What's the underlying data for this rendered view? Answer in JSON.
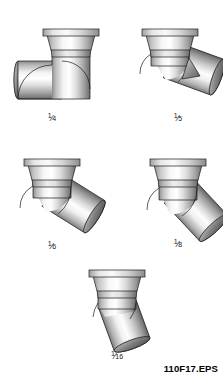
{
  "figure": {
    "id_label": "110F17.EPS",
    "background_color": "#ffffff",
    "line_color": "#1a1a1a",
    "metal_light": "#ffffff",
    "metal_mid": "#c9c9c9",
    "metal_dark": "#6e6e6e",
    "metal_shadow": "#4a4a4a"
  },
  "fittings": [
    {
      "key": "quarter-bend",
      "label_numerator": "1",
      "label_slash": "⁄",
      "label_denominator": "4",
      "label_text": "1⁄4",
      "angle_degrees": 90,
      "position": {
        "label_x": 52,
        "label_y": 112
      }
    },
    {
      "key": "fifth-bend",
      "label_numerator": "1",
      "label_slash": "⁄",
      "label_denominator": "5",
      "label_text": "1⁄5",
      "angle_degrees": 72,
      "position": {
        "label_x": 178,
        "label_y": 112
      }
    },
    {
      "key": "sixth-bend",
      "label_numerator": "1",
      "label_slash": "⁄",
      "label_denominator": "6",
      "label_text": "1⁄6",
      "angle_degrees": 60,
      "position": {
        "label_x": 52,
        "label_y": 240
      }
    },
    {
      "key": "eighth-bend",
      "label_numerator": "1",
      "label_slash": "⁄",
      "label_denominator": "8",
      "label_text": "1⁄8",
      "angle_degrees": 45,
      "position": {
        "label_x": 178,
        "label_y": 238
      }
    },
    {
      "key": "sixteenth-bend",
      "label_numerator": "1",
      "label_slash": "⁄",
      "label_denominator": "16",
      "label_text": "1⁄16",
      "angle_degrees": 22.5,
      "position": {
        "label_x": 117,
        "label_y": 350
      }
    }
  ]
}
